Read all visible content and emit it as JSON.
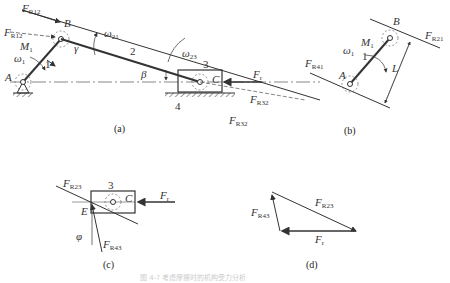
{
  "figure": {
    "caption": "图 4-?  考虑摩擦时的机构受力分析",
    "subfigures": {
      "a": {
        "label": "(a)",
        "points": {
          "A": "A",
          "B": "B",
          "C": "C"
        },
        "links": {
          "crank": "1",
          "coupler": "2",
          "slider": "3",
          "frame": "4"
        },
        "forces": {
          "FR12_top": {
            "main": "F",
            "sub": "R12"
          },
          "FR12_dashed": {
            "main": "F",
            "sub": "R12"
          },
          "FR32_dashed": {
            "main": "F",
            "sub": "R32"
          },
          "FR32_solid": {
            "main": "F",
            "sub": "R32"
          },
          "Fr": {
            "main": "F",
            "sub": "r"
          }
        },
        "moments": {
          "M1": {
            "main": "M",
            "sub": "1"
          }
        },
        "angular_velocities": {
          "omega1": {
            "main": "ω",
            "sub": "1"
          },
          "omega21": {
            "main": "ω",
            "sub": "21"
          },
          "omega23": {
            "main": "ω",
            "sub": "23"
          }
        },
        "angles": {
          "gamma": "γ",
          "beta": "β"
        }
      },
      "b": {
        "label": "(b)",
        "points": {
          "A": "A",
          "B": "B"
        },
        "link": "1",
        "forces": {
          "FR21": {
            "main": "F",
            "sub": "R21"
          },
          "FR41": {
            "main": "F",
            "sub": "R41"
          }
        },
        "moment": {
          "main": "M",
          "sub": "1"
        },
        "omega": {
          "main": "ω",
          "sub": "1"
        },
        "distance": "L"
      },
      "c": {
        "label": "(c)",
        "points": {
          "C": "C",
          "E": "E"
        },
        "link": "3",
        "forces": {
          "FR23": {
            "main": "F",
            "sub": "R23"
          },
          "FR43": {
            "main": "F",
            "sub": "R43"
          },
          "Fr": {
            "main": "F",
            "sub": "r"
          }
        },
        "angle": "φ"
      },
      "d": {
        "label": "(d)",
        "forces": {
          "FR23": {
            "main": "F",
            "sub": "R23"
          },
          "FR43": {
            "main": "F",
            "sub": "R43"
          },
          "Fr": {
            "main": "F",
            "sub": "r"
          }
        }
      }
    }
  },
  "colors": {
    "line": "#333333",
    "dashed": "#666666",
    "text": "#333333"
  }
}
